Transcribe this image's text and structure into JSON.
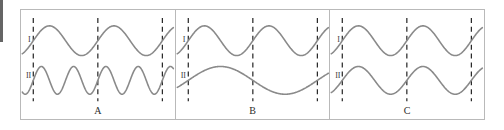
{
  "figure": {
    "caption_row": [
      "A",
      "B",
      "C"
    ],
    "trace_labels": {
      "top": "I",
      "bottom": "II"
    },
    "colors": {
      "wave": "#8a8a8a",
      "dashed_line": "#2a2a2a",
      "frame": "#b9b9b9",
      "background": "#ffffff",
      "label_text": "#2b2b2b"
    },
    "geometry": {
      "frame_x": 20,
      "frame_y": 9,
      "frame_width": 465,
      "frame_height": 111,
      "panel_count": 3
    }
  },
  "chart_data": {
    "type": "line",
    "title": "",
    "xlabel": "",
    "ylabel": "",
    "grid": false,
    "legend_position": "left-inline",
    "x_range": [
      0,
      1
    ],
    "dashed_reference_lines_x": [
      0.08,
      0.5,
      0.92
    ],
    "panels": [
      {
        "label": "A",
        "relationship": "trace II has twice the frequency of trace I",
        "series": [
          {
            "name": "I",
            "position": "top",
            "cycles_between_outer_dashes": 2,
            "frequency": 2,
            "amplitude": 1,
            "phase_deg": 0,
            "baseline_y": 31,
            "amplitude_px": 15
          },
          {
            "name": "II",
            "position": "bottom",
            "cycles_between_outer_dashes": 4,
            "frequency": 4,
            "amplitude": 1,
            "phase_deg": 0,
            "baseline_y": 71,
            "amplitude_px": 14
          }
        ]
      },
      {
        "label": "B",
        "relationship": "trace II has half the frequency of trace I",
        "series": [
          {
            "name": "I",
            "position": "top",
            "cycles_between_outer_dashes": 2,
            "frequency": 2,
            "amplitude": 1,
            "phase_deg": 0,
            "baseline_y": 31,
            "amplitude_px": 15
          },
          {
            "name": "II",
            "position": "bottom",
            "cycles_between_outer_dashes": 1,
            "frequency": 1,
            "amplitude": 1,
            "phase_deg": 0,
            "baseline_y": 71,
            "amplitude_px": 14
          }
        ]
      },
      {
        "label": "C",
        "relationship": "trace I and trace II have the same frequency and phase",
        "series": [
          {
            "name": "I",
            "position": "top",
            "cycles_between_outer_dashes": 2,
            "frequency": 2,
            "amplitude": 1,
            "phase_deg": 0,
            "baseline_y": 31,
            "amplitude_px": 15
          },
          {
            "name": "II",
            "position": "bottom",
            "cycles_between_outer_dashes": 2,
            "frequency": 2,
            "amplitude": 1,
            "phase_deg": 0,
            "baseline_y": 71,
            "amplitude_px": 14
          }
        ]
      }
    ]
  }
}
